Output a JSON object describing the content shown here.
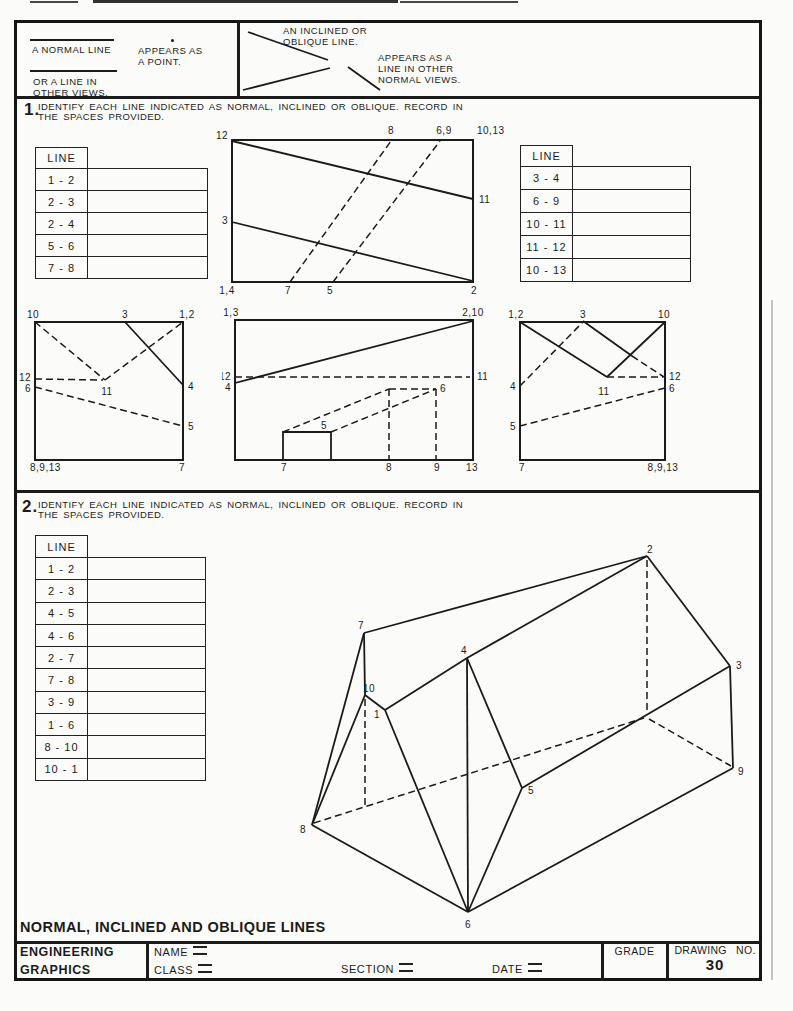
{
  "header": {
    "normal_label": "A NORMAL LINE",
    "appears_point_1": "APPEARS AS",
    "appears_point_2": "A POINT.",
    "or_line_1": "OR A LINE IN",
    "or_line_2": "OTHER VIEWS.",
    "inclined_label_1": "AN INCLINED OR",
    "inclined_label_2": "OBLIQUE LINE.",
    "inclined_appears_1": "APPEARS AS A",
    "inclined_appears_2": "LINE IN OTHER",
    "inclined_appears_3": "NORMAL VIEWS."
  },
  "section1": {
    "number": "1.",
    "instruction1": "IDENTIFY EACH LINE INDICATED AS NORMAL, INCLINED OR OBLIQUE.  RECORD IN",
    "instruction2": "THE SPACES PROVIDED.",
    "left_table": {
      "header": "LINE",
      "rows": [
        "1 - 2",
        "2 - 3",
        "2 - 4",
        "5 - 6",
        "7 - 8"
      ]
    },
    "right_table": {
      "header": "LINE",
      "rows": [
        "3 - 4",
        "6 - 9",
        "10 - 11",
        "11 - 12",
        "10 - 13"
      ]
    },
    "fig_top_labels": [
      "12",
      "8",
      "6,9",
      "10,13",
      "11",
      "3",
      "1,4",
      "7",
      "5",
      "2"
    ],
    "viewA_labels": [
      "10",
      "3",
      "1,2",
      "12",
      "6",
      "11",
      "4",
      "5",
      "8,9,13",
      "7"
    ],
    "viewB_labels": [
      "1,3",
      "2,10",
      "12",
      "4",
      "11",
      "6",
      "5",
      "7",
      "8",
      "9",
      "13"
    ],
    "viewC_labels": [
      "1,2",
      "3",
      "10",
      "4",
      "12",
      "6",
      "11",
      "5",
      "7",
      "8,9,13"
    ]
  },
  "section2": {
    "number": "2.",
    "instruction1": "IDENTIFY EACH LINE INDICATED AS NORMAL, INCLINED OR OBLIQUE.  RECORD IN",
    "instruction2": "THE SPACES PROVIDED.",
    "table": {
      "header": "LINE",
      "rows": [
        "1 - 2",
        "2 - 3",
        "4 - 5",
        "4 - 6",
        "2 - 7",
        "7 - 8",
        "3 - 9",
        "1 - 6",
        "8 - 10",
        "10 - 1"
      ]
    },
    "pictorial_labels": [
      "2",
      "7",
      "4",
      "3",
      "10",
      "1",
      "5",
      "6",
      "8",
      "9"
    ]
  },
  "title": "NORMAL, INCLINED AND OBLIQUE LINES",
  "footer": {
    "org_line1": "ENGINEERING",
    "org_line2": "GRAPHICS",
    "name_label": "NAME",
    "class_label": "CLASS",
    "section_label": "SECTION",
    "date_label": "DATE",
    "grade_label": "GRADE",
    "drawing_no_label": "DRAWING NO.",
    "drawing_no_value": "30"
  }
}
